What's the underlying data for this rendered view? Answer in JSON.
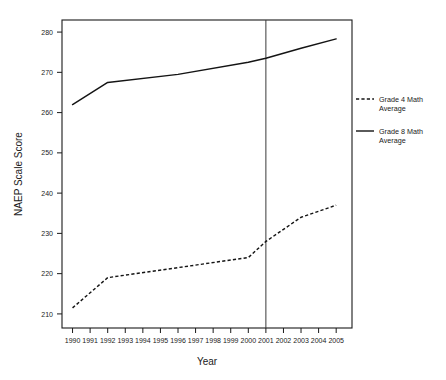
{
  "chart_data": {
    "type": "line",
    "title": "",
    "xlabel": "Year",
    "ylabel": "NAEP Scale Score",
    "x": [
      1990,
      1991,
      1992,
      1993,
      1994,
      1995,
      1996,
      1997,
      1998,
      1999,
      2000,
      2001,
      2002,
      2003,
      2004,
      2005
    ],
    "xtick_labels": [
      "1990",
      "1991",
      "1992",
      "1993",
      "1994",
      "1995",
      "1996",
      "1997",
      "1998",
      "1999",
      "2000",
      "2001",
      "2002",
      "2003",
      "2004",
      "2005"
    ],
    "ytick_labels": [
      "210",
      "220",
      "230",
      "240",
      "250",
      "260",
      "270",
      "280"
    ],
    "yticks": [
      210,
      220,
      230,
      240,
      250,
      260,
      270,
      280
    ],
    "ylim": [
      206.5,
      283.0
    ],
    "xlim": [
      1989.4,
      2005.9
    ],
    "grid": false,
    "legend_position": "right",
    "annotations": [
      {
        "name": "reference-line-2001",
        "type": "vline",
        "x": 2001
      }
    ],
    "series": [
      {
        "name": "Grade 4 Math Average",
        "style": "dashed",
        "color": "#141414",
        "points": [
          {
            "x": 1990,
            "y": 211.5
          },
          {
            "x": 1992,
            "y": 219.0
          },
          {
            "x": 1996,
            "y": 221.5
          },
          {
            "x": 2000,
            "y": 224.0
          },
          {
            "x": 2001,
            "y": 228.0
          },
          {
            "x": 2003,
            "y": 234.0
          },
          {
            "x": 2005,
            "y": 237.0
          }
        ]
      },
      {
        "name": "Grade 8 Math Average",
        "style": "solid",
        "color": "#141414",
        "points": [
          {
            "x": 1990,
            "y": 262.0
          },
          {
            "x": 1992,
            "y": 267.5
          },
          {
            "x": 1996,
            "y": 269.5
          },
          {
            "x": 2000,
            "y": 272.5
          },
          {
            "x": 2001,
            "y": 273.5
          },
          {
            "x": 2003,
            "y": 276.0
          },
          {
            "x": 2005,
            "y": 278.3
          }
        ]
      }
    ]
  },
  "legend": {
    "items": [
      {
        "label_line1": "Grade 4 Math",
        "label_line2": "Average",
        "style": "dashed"
      },
      {
        "label_line1": "Grade 8 Math",
        "label_line2": "Average",
        "style": "solid"
      }
    ]
  },
  "colors": {
    "ink": "#141414",
    "axis": "#1a1a1a",
    "background": "#ffffff"
  }
}
